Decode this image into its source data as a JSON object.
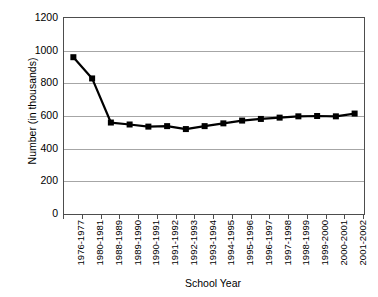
{
  "chart_data": {
    "type": "line",
    "title": "",
    "xlabel": "School Year",
    "ylabel": "Number (in thousands)",
    "ylim": [
      0,
      1200
    ],
    "yticks": [
      1200,
      1000,
      800,
      600,
      400,
      200,
      0
    ],
    "ytick_labels": [
      "1200",
      "1000",
      "800",
      "600",
      "400",
      "200",
      "0"
    ],
    "grid": true,
    "legend": "none",
    "marker": "square",
    "series_color": "#000000",
    "gridline_color": "#a6a6a6",
    "axis_color": "#4d4d4d",
    "categories": [
      "1976-1977",
      "1980-1981",
      "1988-1989",
      "1989-1990",
      "1990-1991",
      "1991-1992",
      "1992-1993",
      "1993-1994",
      "1994-1995",
      "1995-1996",
      "1996-1997",
      "1997-1998",
      "1998-1999",
      "1999-2000",
      "2000-2001",
      "2001-2002"
    ],
    "values": [
      960,
      830,
      560,
      548,
      535,
      538,
      520,
      538,
      555,
      572,
      582,
      590,
      598,
      600,
      598,
      615
    ]
  }
}
